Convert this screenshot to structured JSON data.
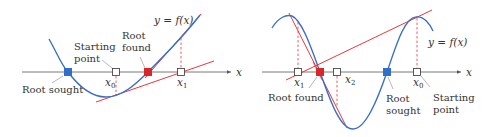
{
  "colors": {
    "curve": "#3a6fc4",
    "tangent": "#e8383d",
    "axis": "#555555",
    "root_sought": "#2f6fc9",
    "root_found": "#d9262b",
    "text": "#333333"
  },
  "left_panel": {
    "curve_label": "y = f(x)",
    "axis_label": "x",
    "labels": {
      "starting_point_line1": "Starting",
      "starting_point_line2": "point",
      "root_found_line1": "Root",
      "root_found_line2": "found",
      "root_sought": "Root sought",
      "x0": "x",
      "x0_sub": "0",
      "x1": "x",
      "x1_sub": "1"
    }
  },
  "right_panel": {
    "curve_label": "y = f(x)",
    "axis_label": "x",
    "labels": {
      "root_found": "Root found",
      "root_sought_line1": "Root",
      "root_sought_line2": "sought",
      "starting_point_line1": "Starting",
      "starting_point_line2": "point",
      "x0": "x",
      "x0_sub": "0",
      "x1": "x",
      "x1_sub": "1",
      "x2": "x",
      "x2_sub": "2"
    }
  }
}
